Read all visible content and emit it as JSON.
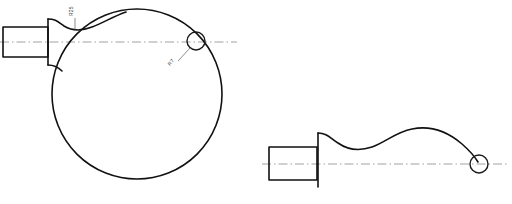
{
  "drawing": {
    "title": "Machine Part Profile Drawing",
    "background_color": "#ffffff",
    "line_color": "#111111",
    "centerline_color": "#8c8c8c",
    "canvas": {
      "width": 512,
      "height": 204
    },
    "views": [
      {
        "name": "front-view",
        "label": "Front View",
        "centerline_y": 42,
        "elements": {
          "stem_rect": {
            "x": 3,
            "y": 27,
            "width": 45,
            "height": 30
          },
          "flange_line": {
            "x": 48,
            "y_top": 19,
            "y_bottom": 65
          },
          "body_circle": {
            "cx": 137,
            "cy": 94,
            "r": 85
          },
          "detail_circle": {
            "cx": 196,
            "cy": 41,
            "r": 9
          },
          "centerline": {
            "x1": 0,
            "x2": 237,
            "y": 42
          }
        },
        "annotations": [
          {
            "name": "neck-dimension",
            "text": "R25",
            "leader_x": 75,
            "leader_y_top": 18,
            "leader_y_bottom": 32,
            "rotation": -90
          },
          {
            "name": "hole-dimension",
            "text": "R7",
            "leader_from": {
              "x": 189,
              "y": 48
            },
            "leader_to": {
              "x": 177,
              "y": 62
            },
            "rotation": -50
          }
        ]
      },
      {
        "name": "side-view",
        "label": "Side View",
        "centerline_y": 164,
        "elements": {
          "stem_rect": {
            "x": 269,
            "y": 147,
            "width": 48,
            "height": 33
          },
          "flange_line": {
            "x": 318,
            "y_top": 133,
            "y_bottom": 187
          },
          "detail_circle": {
            "cx": 479,
            "cy": 164,
            "r": 9
          },
          "centerline": {
            "x1": 262,
            "x2": 508,
            "y": 164
          }
        },
        "annotations": []
      }
    ]
  }
}
